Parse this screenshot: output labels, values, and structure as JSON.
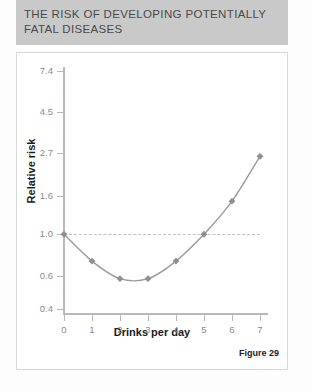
{
  "header": {
    "line1": "THE RISK OF DEVELOPING POTENTIALLY",
    "line2": "FATAL DISEASES"
  },
  "figure_label": "Figure 29",
  "colors": {
    "header_background": "#c9c9c9",
    "header_text": "#4a4a4a",
    "axis": "#b9b9b9",
    "tick_text": "#8a8a8a",
    "series_line": "#9a9a9a",
    "marker": "#8f8f8f",
    "reference_line": "#c2c2c2",
    "panel_border": "#d8d8d8"
  },
  "chart_data": {
    "type": "line",
    "title": "THE RISK OF DEVELOPING POTENTIALLY FATAL DISEASES",
    "xlabel": "Drinks per day",
    "ylabel": "Relative risk",
    "x": [
      0,
      1,
      2,
      3,
      4,
      5,
      6,
      7
    ],
    "values": [
      1.0,
      0.72,
      0.58,
      0.58,
      0.72,
      1.0,
      1.5,
      2.6
    ],
    "xticklabels": [
      "0",
      "1",
      "2",
      "3",
      "4",
      "5",
      "6",
      "7"
    ],
    "yticklabels": [
      "7.4",
      "4.5",
      "2.7",
      "1.6",
      "1.0",
      "0.6",
      "0.4"
    ],
    "ytickvalues": [
      7.4,
      4.5,
      2.7,
      1.6,
      1.0,
      0.6,
      0.4
    ],
    "yscale": "log",
    "ylim": [
      0.4,
      7.4
    ],
    "xlim": [
      0,
      7
    ],
    "grid": false,
    "legend": false,
    "reference_line": 1.0,
    "marker": "diamond",
    "annotation": "Figure 29"
  }
}
